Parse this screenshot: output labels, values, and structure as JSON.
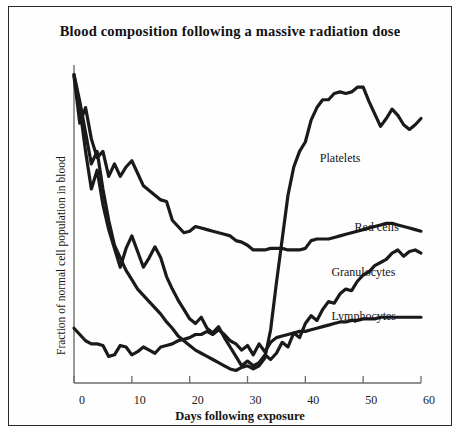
{
  "figure": {
    "title": "Blood composition following a massive radiation dose",
    "xlabel": "Days following exposure",
    "ylabel": "Fraction of normal cell population in blood"
  },
  "axis": {
    "xticks": [
      "0",
      "10",
      "20",
      "30",
      "40",
      "50",
      "60"
    ]
  },
  "labels": {
    "platelets": "Platelets",
    "red_cells": "Red cells",
    "granulocytes": "Granulocytes",
    "lymphocytes": "Lymphocytes"
  },
  "chart_data": {
    "type": "line",
    "title": "Blood composition following a massive radiation dose",
    "xlabel": "Days following exposure",
    "ylabel": "Fraction of normal cell population in blood",
    "xlim": [
      0,
      60
    ],
    "ylim": [
      0,
      1
    ],
    "grid": false,
    "legend": "inline-annotations",
    "line_color": "#1a1a1a",
    "xticks": [
      0,
      10,
      20,
      30,
      40,
      50,
      60
    ],
    "series": [
      {
        "name": "Platelets",
        "label_x": 47,
        "label_y": 0.72,
        "x": [
          0,
          1,
          2,
          3,
          4,
          5,
          6,
          7,
          8,
          9,
          10,
          11,
          12,
          13,
          14,
          15,
          16,
          17,
          18,
          19,
          20,
          21,
          22,
          23,
          24,
          25,
          26,
          27,
          28,
          29,
          30,
          31,
          32,
          33,
          34,
          35,
          36,
          37,
          38,
          39,
          40,
          41,
          42,
          43,
          44,
          45,
          46,
          47,
          48,
          49,
          50,
          51,
          52,
          53,
          54,
          55,
          56,
          57,
          58,
          59,
          60
        ],
        "y": [
          0.985,
          0.9,
          0.8,
          0.7,
          0.74,
          0.62,
          0.52,
          0.44,
          0.4,
          0.36,
          0.33,
          0.3,
          0.28,
          0.26,
          0.24,
          0.22,
          0.195,
          0.175,
          0.15,
          0.135,
          0.12,
          0.105,
          0.095,
          0.085,
          0.075,
          0.065,
          0.055,
          0.045,
          0.04,
          0.05,
          0.055,
          0.045,
          0.055,
          0.08,
          0.17,
          0.32,
          0.46,
          0.6,
          0.69,
          0.74,
          0.77,
          0.84,
          0.88,
          0.905,
          0.905,
          0.925,
          0.93,
          0.925,
          0.93,
          0.945,
          0.945,
          0.9,
          0.86,
          0.82,
          0.845,
          0.875,
          0.855,
          0.825,
          0.81,
          0.825,
          0.845
        ]
      },
      {
        "name": "Red cells",
        "label_x": 53,
        "label_y": 0.5,
        "x": [
          0,
          1,
          2,
          3,
          4,
          5,
          6,
          7,
          8,
          9,
          10,
          11,
          12,
          13,
          14,
          15,
          16,
          17,
          18,
          19,
          20,
          21,
          22,
          23,
          24,
          25,
          26,
          27,
          28,
          29,
          30,
          31,
          32,
          33,
          34,
          35,
          36,
          37,
          38,
          39,
          40,
          41,
          42,
          43,
          44,
          45,
          46,
          47,
          48,
          49,
          50,
          51,
          52,
          53,
          54,
          55,
          56,
          57,
          58,
          59,
          60
        ],
        "y": [
          0.98,
          0.83,
          0.88,
          0.78,
          0.72,
          0.74,
          0.66,
          0.7,
          0.66,
          0.69,
          0.71,
          0.67,
          0.63,
          0.615,
          0.6,
          0.585,
          0.58,
          0.52,
          0.5,
          0.48,
          0.485,
          0.5,
          0.495,
          0.49,
          0.485,
          0.48,
          0.475,
          0.47,
          0.455,
          0.45,
          0.44,
          0.425,
          0.425,
          0.425,
          0.43,
          0.43,
          0.43,
          0.425,
          0.425,
          0.425,
          0.43,
          0.455,
          0.46,
          0.46,
          0.46,
          0.465,
          0.47,
          0.475,
          0.48,
          0.485,
          0.49,
          0.495,
          0.5,
          0.505,
          0.51,
          0.51,
          0.505,
          0.5,
          0.495,
          0.49,
          0.485
        ]
      },
      {
        "name": "Granulocytes",
        "label_x": 49,
        "label_y": 0.355,
        "x": [
          0,
          1,
          2,
          3,
          4,
          5,
          6,
          7,
          8,
          9,
          10,
          11,
          12,
          13,
          14,
          15,
          16,
          17,
          18,
          19,
          20,
          21,
          22,
          23,
          24,
          25,
          26,
          27,
          28,
          29,
          30,
          31,
          32,
          33,
          34,
          35,
          36,
          37,
          38,
          39,
          40,
          41,
          42,
          43,
          44,
          45,
          46,
          47,
          48,
          49,
          50,
          51,
          52,
          53,
          54,
          55,
          56,
          57,
          58,
          59,
          60
        ],
        "y": [
          0.985,
          0.88,
          0.74,
          0.62,
          0.68,
          0.57,
          0.49,
          0.43,
          0.37,
          0.43,
          0.47,
          0.42,
          0.37,
          0.4,
          0.435,
          0.4,
          0.34,
          0.3,
          0.265,
          0.235,
          0.205,
          0.19,
          0.21,
          0.175,
          0.16,
          0.18,
          0.145,
          0.115,
          0.085,
          0.055,
          0.07,
          0.055,
          0.065,
          0.09,
          0.075,
          0.095,
          0.13,
          0.115,
          0.16,
          0.145,
          0.19,
          0.215,
          0.2,
          0.235,
          0.26,
          0.255,
          0.285,
          0.3,
          0.295,
          0.325,
          0.345,
          0.355,
          0.375,
          0.385,
          0.395,
          0.415,
          0.425,
          0.405,
          0.42,
          0.425,
          0.415
        ]
      },
      {
        "name": "Lymphocytes",
        "label_x": 49,
        "label_y": 0.215,
        "x": [
          0,
          1,
          2,
          3,
          4,
          5,
          6,
          7,
          8,
          9,
          10,
          11,
          12,
          13,
          14,
          15,
          16,
          17,
          18,
          19,
          20,
          21,
          22,
          23,
          24,
          25,
          26,
          27,
          28,
          29,
          30,
          31,
          32,
          33,
          34,
          35,
          36,
          37,
          38,
          39,
          40,
          41,
          42,
          43,
          44,
          45,
          46,
          47,
          48,
          49,
          50,
          51,
          52,
          53,
          54,
          55,
          56,
          57,
          58,
          59,
          60
        ],
        "y": [
          0.175,
          0.155,
          0.135,
          0.125,
          0.125,
          0.12,
          0.085,
          0.09,
          0.12,
          0.115,
          0.09,
          0.1,
          0.115,
          0.105,
          0.095,
          0.115,
          0.12,
          0.125,
          0.135,
          0.14,
          0.145,
          0.155,
          0.155,
          0.165,
          0.155,
          0.17,
          0.155,
          0.135,
          0.125,
          0.105,
          0.12,
          0.09,
          0.125,
          0.1,
          0.13,
          0.145,
          0.15,
          0.155,
          0.16,
          0.165,
          0.165,
          0.17,
          0.175,
          0.18,
          0.185,
          0.19,
          0.195,
          0.195,
          0.2,
          0.2,
          0.205,
          0.205,
          0.205,
          0.21,
          0.21,
          0.21,
          0.21,
          0.21,
          0.21,
          0.21,
          0.21
        ]
      }
    ]
  }
}
